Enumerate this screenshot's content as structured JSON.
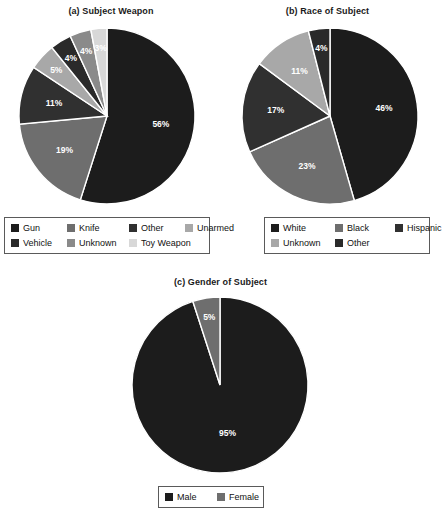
{
  "chart_data": [
    {
      "type": "pie",
      "id": "a",
      "title": "(a) Subject Weapon",
      "categories": [
        "Gun",
        "Knife",
        "Other",
        "Unarmed",
        "Vehicle",
        "Unknown",
        "Toy Weapon"
      ],
      "values": [
        56,
        19,
        11,
        5,
        4,
        4,
        3
      ],
      "labels": [
        "56%",
        "19%",
        "11%",
        "5%",
        "4%",
        "4%",
        "3%"
      ],
      "colors": [
        "#1c1c1c",
        "#6e6e6e",
        "#303030",
        "#a8a8a8",
        "#2a2a2a",
        "#8a8a8a",
        "#d8d8d8"
      ],
      "legend_columns": 4,
      "start_angle": 0,
      "direction": "clockwise",
      "xlabel": "",
      "ylabel": ""
    },
    {
      "type": "pie",
      "id": "b",
      "title": "(b) Race of Subject",
      "categories": [
        "White",
        "Black",
        "Hispanic",
        "Unknown",
        "Other"
      ],
      "values": [
        46,
        23,
        17,
        11,
        4
      ],
      "labels": [
        "46%",
        "23%",
        "17%",
        "11%",
        "4%"
      ],
      "colors": [
        "#1c1c1c",
        "#6e6e6e",
        "#303030",
        "#a8a8a8",
        "#2a2a2a"
      ],
      "legend_columns": 3,
      "start_angle": 0,
      "direction": "clockwise",
      "xlabel": "",
      "ylabel": ""
    },
    {
      "type": "pie",
      "id": "c",
      "title": "(c) Gender of Subject",
      "categories": [
        "Male",
        "Female"
      ],
      "values": [
        95,
        5
      ],
      "labels": [
        "95%",
        "5%"
      ],
      "colors": [
        "#1c1c1c",
        "#6e6e6e"
      ],
      "legend_columns": 2,
      "start_angle": 0,
      "direction": "clockwise",
      "xlabel": "",
      "ylabel": ""
    }
  ],
  "figure": {
    "background": "#ffffff",
    "label_text_color": "#ffffff",
    "legend_border_color": "#5a5a5a",
    "slice_separator_color": "#ffffff"
  }
}
